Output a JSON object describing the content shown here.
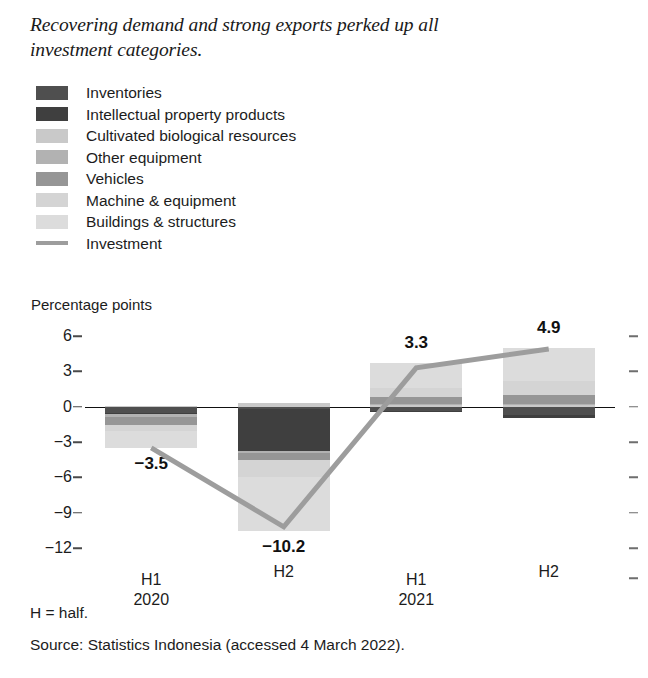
{
  "title": "Recovering demand and strong exports perked up all investment categories.",
  "legend": {
    "items": [
      {
        "label": "Inventories",
        "color": "#4f4f4f",
        "marker": "box"
      },
      {
        "label": "Intellectual property products",
        "color": "#3f3f3f",
        "marker": "box"
      },
      {
        "label": "Cultivated biological resources",
        "color": "#c9c9c9",
        "marker": "box"
      },
      {
        "label": "Other equipment",
        "color": "#b2b2b2",
        "marker": "box"
      },
      {
        "label": "Vehicles",
        "color": "#969696",
        "marker": "box"
      },
      {
        "label": "Machine & equipment",
        "color": "#d4d4d4",
        "marker": "box"
      },
      {
        "label": "Buildings & structures",
        "color": "#dcdcdc",
        "marker": "box"
      },
      {
        "label": "Investment",
        "color": "#9d9d9d",
        "marker": "line"
      }
    ]
  },
  "footer": {
    "note": "H = half.",
    "source": "Source: Statistics Indonesia (accessed 4 March 2022)."
  },
  "chart_data": {
    "type": "bar",
    "subtype": "stacked-bar-with-line",
    "title": "Recovering demand and strong exports perked up all investment categories.",
    "ylabel": "Percentage points",
    "xlabel": "",
    "ylim": [
      -12,
      6
    ],
    "yticks": [
      6,
      3,
      0,
      -3,
      -6,
      -9,
      -12
    ],
    "ytick_labels": [
      "6",
      "3",
      "0",
      "-3",
      "-6",
      "-9",
      "-12"
    ],
    "grid": false,
    "legend_position": "top-left",
    "categories": [
      "H1",
      "H2",
      "H1",
      "H2"
    ],
    "category_groups": [
      "2020",
      "",
      "2021",
      ""
    ],
    "xtick_labels": [
      {
        "half": "H1",
        "year": "2020"
      },
      {
        "half": "H2",
        "year": ""
      },
      {
        "half": "H1",
        "year": "2021"
      },
      {
        "half": "H2",
        "year": ""
      }
    ],
    "series": [
      {
        "name": "Inventories",
        "color": "#4f4f4f",
        "values": [
          -0.5,
          -0.2,
          -0.35,
          -0.7
        ]
      },
      {
        "name": "Intellectual property products",
        "color": "#3f3f3f",
        "values": [
          -0.15,
          -3.6,
          -0.1,
          -0.25
        ]
      },
      {
        "name": "Cultivated biological resources",
        "color": "#c9c9c9",
        "values": [
          0.05,
          0.35,
          0.1,
          0.1
        ]
      },
      {
        "name": "Other equipment",
        "color": "#b2b2b2",
        "values": [
          -0.2,
          -0.15,
          0.15,
          0.15
        ]
      },
      {
        "name": "Vehicles",
        "color": "#969696",
        "values": [
          -0.7,
          -0.55,
          0.55,
          0.75
        ]
      },
      {
        "name": "Machine & equipment",
        "color": "#d4d4d4",
        "values": [
          -0.55,
          -1.5,
          0.75,
          1.2
        ]
      },
      {
        "name": "Buildings & structures",
        "color": "#dcdcdc",
        "values": [
          -1.45,
          -4.55,
          2.2,
          2.75
        ]
      }
    ],
    "line_series": {
      "name": "Investment",
      "color": "#9d9d9d",
      "values": [
        -3.5,
        -10.2,
        3.3,
        4.9
      ]
    },
    "data_labels": [
      "-3.5",
      "-10.2",
      "3.3",
      "4.9"
    ],
    "totals": [
      -3.5,
      -10.2,
      3.3,
      4.9
    ]
  }
}
